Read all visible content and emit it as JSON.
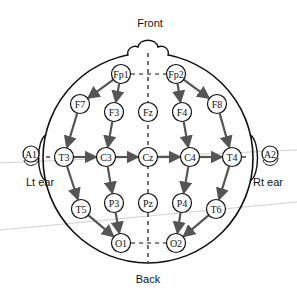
{
  "title_front": "Front",
  "title_back": "Back",
  "ears": {
    "left": {
      "electrode": "A1",
      "label": "Lt ear"
    },
    "right": {
      "electrode": "A2",
      "label": "Rt ear"
    }
  },
  "electrodes": [
    {
      "id": "Fp1",
      "x": 121,
      "y": 74
    },
    {
      "id": "Fp2",
      "x": 176,
      "y": 74
    },
    {
      "id": "F7",
      "x": 80,
      "y": 104
    },
    {
      "id": "F3",
      "x": 114,
      "y": 112
    },
    {
      "id": "Fz",
      "x": 148,
      "y": 112
    },
    {
      "id": "F4",
      "x": 182,
      "y": 112
    },
    {
      "id": "F8",
      "x": 217,
      "y": 104
    },
    {
      "id": "T3",
      "x": 64,
      "y": 157
    },
    {
      "id": "C3",
      "x": 106,
      "y": 157
    },
    {
      "id": "Cz",
      "x": 148,
      "y": 157
    },
    {
      "id": "C4",
      "x": 190,
      "y": 157
    },
    {
      "id": "T4",
      "x": 232,
      "y": 157
    },
    {
      "id": "T5",
      "x": 81,
      "y": 209
    },
    {
      "id": "P3",
      "x": 114,
      "y": 203
    },
    {
      "id": "Pz",
      "x": 148,
      "y": 203
    },
    {
      "id": "P4",
      "x": 182,
      "y": 203
    },
    {
      "id": "T6",
      "x": 216,
      "y": 209
    },
    {
      "id": "O1",
      "x": 121,
      "y": 243
    },
    {
      "id": "O2",
      "x": 176,
      "y": 243
    }
  ],
  "arrows": [
    [
      "Fp1",
      "F7"
    ],
    [
      "F7",
      "T3"
    ],
    [
      "T3",
      "T5"
    ],
    [
      "T5",
      "O1"
    ],
    [
      "Fp1",
      "F3"
    ],
    [
      "F3",
      "C3"
    ],
    [
      "C3",
      "P3"
    ],
    [
      "P3",
      "O1"
    ],
    [
      "Fp2",
      "F4"
    ],
    [
      "F4",
      "C4"
    ],
    [
      "C4",
      "P4"
    ],
    [
      "P4",
      "O2"
    ],
    [
      "Fp2",
      "F8"
    ],
    [
      "F8",
      "T4"
    ],
    [
      "T4",
      "T6"
    ],
    [
      "T6",
      "O2"
    ],
    [
      "T3",
      "C3"
    ],
    [
      "C3",
      "Cz"
    ],
    [
      "Cz",
      "C4"
    ],
    [
      "C4",
      "T4"
    ]
  ],
  "colors": {
    "line": "#111111",
    "arrow": "#555555",
    "guide": "#c8c8c8"
  }
}
